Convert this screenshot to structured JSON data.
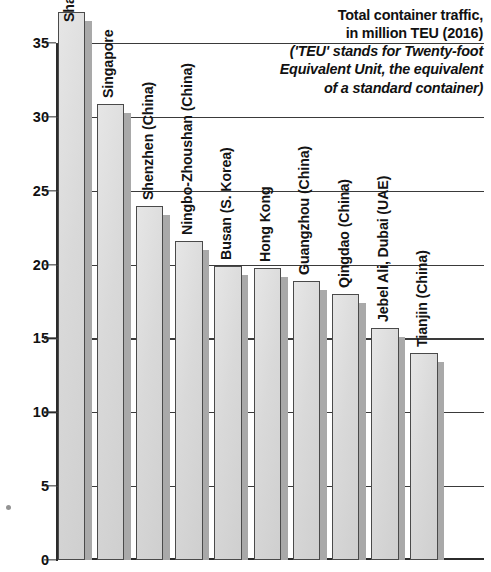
{
  "title": {
    "line1": "Total container traffic,",
    "line2": "in million TEU (2016)",
    "line3": "('TEU' stands for Twenty-foot",
    "line4": "Equivalent Unit, the equivalent",
    "line5": "of a standard container)"
  },
  "axis": {
    "ticks": [
      "0",
      "5",
      "10",
      "15",
      "20",
      "25",
      "30",
      "35"
    ]
  },
  "chart_data": {
    "type": "bar",
    "title": "Total container traffic, in million TEU (2016)",
    "subtitle": "('TEU' stands for Twenty-foot Equivalent Unit, the equivalent of a standard container)",
    "xlabel": "",
    "ylabel": "million TEU",
    "ylim": [
      0,
      37.8
    ],
    "yticks": [
      0,
      5,
      10,
      15,
      20,
      25,
      30,
      35
    ],
    "grid": true,
    "legend": "none",
    "categories": [
      "Shanghai",
      "Singapore",
      "Shenzhen (China)",
      "Ningbo-Zhoushan (China)",
      "Busan (S. Korea)",
      "Hong Kong",
      "Guangzhou (China)",
      "Qingdao (China)",
      "Jebel Ali, Dubai (UAE)",
      "Tianjin (China)"
    ],
    "values": [
      37.1,
      30.9,
      24.0,
      21.6,
      19.9,
      19.8,
      18.9,
      18.0,
      15.7,
      14.0
    ],
    "bars": [
      {
        "label": "Shanghai",
        "value": 37.1,
        "label_inside": true
      },
      {
        "label": "Singapore",
        "value": 30.9,
        "label_inside": false
      },
      {
        "label": "Shenzhen (China)",
        "value": 24.0,
        "label_inside": false
      },
      {
        "label": "Ningbo-Zhoushan (China)",
        "value": 21.6,
        "label_inside": false
      },
      {
        "label": "Busan (S. Korea)",
        "value": 19.9,
        "label_inside": false
      },
      {
        "label": "Hong Kong",
        "value": 19.8,
        "label_inside": false
      },
      {
        "label": "Guangzhou (China)",
        "value": 18.9,
        "label_inside": false
      },
      {
        "label": "Qingdao (China)",
        "value": 18.0,
        "label_inside": false
      },
      {
        "label": "Jebel Ali, Dubai (UAE)",
        "value": 15.7,
        "label_inside": false
      },
      {
        "label": "Tianjin (China)",
        "value": 14.0,
        "label_inside": false
      }
    ],
    "colors": {
      "bar_fill": "#dcdcdc",
      "bar_edge": "#4a4a4a",
      "bar_shadow": "#a9a9a9",
      "axis": "#2b2b2b",
      "text": "#111111",
      "background": "#ffffff"
    }
  }
}
